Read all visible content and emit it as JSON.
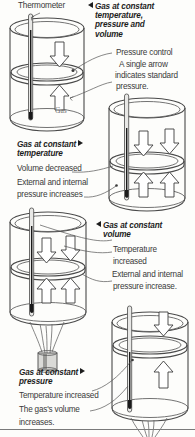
{
  "figure": {
    "title_hidden": "Gas laws: constant temperature, volume and pressure",
    "style": "grayscale line illustration"
  },
  "labels": {
    "thermometer": "Thermometer",
    "gas": "Gas"
  },
  "annotations": [
    {
      "id": "pressure-control",
      "text": "Pressure control"
    },
    {
      "id": "single-arrow-1",
      "text": "A single arrow"
    },
    {
      "id": "single-arrow-2",
      "text": "indicates standard"
    },
    {
      "id": "single-arrow-3",
      "text": "pressure."
    }
  ],
  "captions": [
    {
      "id": "constant-tpv",
      "marker": "left",
      "heading": [
        "Gas at constant",
        "temperature,",
        "pressure and",
        "volume"
      ],
      "lines": []
    },
    {
      "id": "constant-temperature",
      "marker": "right",
      "heading": [
        "Gas at constant",
        "temperature"
      ],
      "lines": [
        "Volume decreased",
        "External and internal",
        "pressure increases"
      ]
    },
    {
      "id": "constant-volume",
      "marker": "left",
      "heading": [
        "Gas  at constant",
        "volume"
      ],
      "lines": [
        "Temperature",
        "increased",
        "External and internal",
        "pressure increase."
      ]
    },
    {
      "id": "constant-pressure",
      "marker": "right",
      "heading": [
        "Gas at constant",
        "pressure"
      ],
      "lines": [
        "Temperature increased",
        "The gas's volume",
        "increases."
      ]
    }
  ],
  "diagrams": [
    {
      "id": "cylinder-1",
      "caption_ref": "constant-tpv",
      "piston_position": "middle",
      "arrows": {
        "down": 1,
        "up": 1
      },
      "heat_source": false,
      "thermometer": true,
      "gas_label": "Gas"
    },
    {
      "id": "cylinder-2",
      "caption_ref": "constant-temperature",
      "piston_position": "middle-low",
      "arrows": {
        "down": 2,
        "up": 2
      },
      "heat_source": false,
      "thermometer": true,
      "gas_label": ""
    },
    {
      "id": "cylinder-3",
      "caption_ref": "constant-volume",
      "piston_position": "middle",
      "arrows": {
        "down": 2,
        "up": 2
      },
      "heat_source": true,
      "thermometer": true,
      "gas_label": ""
    },
    {
      "id": "cylinder-4",
      "caption_ref": "constant-pressure",
      "piston_position": "high",
      "arrows": {
        "down": 1,
        "up": 1
      },
      "heat_source": true,
      "thermometer": true,
      "gas_label": ""
    }
  ],
  "colors": {
    "outline": "#4a4a4a",
    "arrow_fill": "#ffffff",
    "text": "#3a3a3a",
    "heading_text": "#1d1d1d",
    "glass_tint": "#d9d9d6",
    "background": "#fdfdfb"
  }
}
